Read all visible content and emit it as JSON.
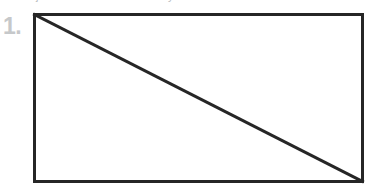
{
  "page": {
    "background_color": "#ffffff",
    "width": 372,
    "height": 191
  },
  "problem": {
    "number_label": "1.",
    "number_color": "#c6c8ca"
  },
  "clipped_header_text": {
    "fragment_left": "j",
    "fragment_right": "y"
  },
  "figure": {
    "shape_name": "rectangle",
    "stroke_color": "#262626",
    "fill_color": "#ffffff",
    "stroke_width": "3",
    "diagonal": {
      "present": "yes",
      "from_corner": "top-left",
      "to_corner": "bottom-right",
      "stroke_color": "#262626",
      "stroke_width": "3"
    }
  }
}
